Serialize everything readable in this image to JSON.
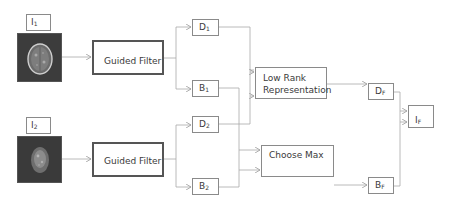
{
  "diagram": {
    "inputs": [
      {
        "id": "I1",
        "label_main": "I",
        "label_sub": "1",
        "image": "mri-brain-axial"
      },
      {
        "id": "I2",
        "label_main": "I",
        "label_sub": "2",
        "image": "pet-brain-axial"
      }
    ],
    "filters": [
      {
        "id": "gf1",
        "label": "Guided Filter"
      },
      {
        "id": "gf2",
        "label": "Guided Filter"
      }
    ],
    "layers": [
      {
        "id": "D1",
        "main": "D",
        "sub": "1"
      },
      {
        "id": "B1",
        "main": "B",
        "sub": "1"
      },
      {
        "id": "D2",
        "main": "D",
        "sub": "2"
      },
      {
        "id": "B2",
        "main": "B",
        "sub": "2"
      }
    ],
    "fusion_rules": {
      "detail": {
        "line1": "Low Rank",
        "line2": "Representation"
      },
      "base": {
        "label": "Choose Max"
      }
    },
    "fused": [
      {
        "id": "DF",
        "main": "D",
        "sub": "F"
      },
      {
        "id": "BF",
        "main": "B",
        "sub": "F"
      }
    ],
    "output": {
      "id": "IF",
      "main": "I",
      "sub": "F"
    },
    "edges": [
      [
        "I1",
        "gf1"
      ],
      [
        "I2",
        "gf2"
      ],
      [
        "gf1",
        "D1"
      ],
      [
        "gf1",
        "B1"
      ],
      [
        "gf2",
        "D2"
      ],
      [
        "gf2",
        "B2"
      ],
      [
        "D1",
        "LRR"
      ],
      [
        "D2",
        "LRR"
      ],
      [
        "B1",
        "ChooseMax"
      ],
      [
        "B2",
        "ChooseMax"
      ],
      [
        "LRR",
        "DF"
      ],
      [
        "ChooseMax",
        "BF"
      ],
      [
        "DF",
        "IF"
      ],
      [
        "BF",
        "IF"
      ]
    ],
    "colors": {
      "line": "#9a9a9a",
      "box_border": "#8a8a8a",
      "thick_border": "#555555"
    }
  }
}
